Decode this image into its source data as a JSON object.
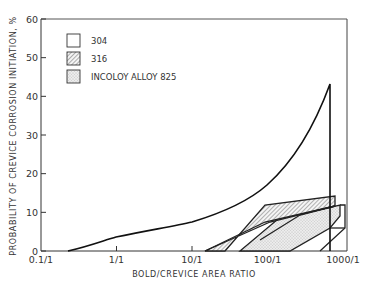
{
  "chart_data": {
    "type": "line",
    "title": "",
    "xlabel": "BOLD/CREVICE AREA RATIO",
    "ylabel": "PROBABILITY OF CREVICE CORROSION INITIATION, %",
    "x_scale": "log",
    "x_ticks": [
      "0.1/1",
      "1/1",
      "10/1",
      "100/1",
      "1000/1"
    ],
    "x_tick_values": [
      0.1,
      1,
      10,
      100,
      1000
    ],
    "y_ticks": [
      "0",
      "10",
      "20",
      "30",
      "40",
      "50",
      "60"
    ],
    "ylim": [
      0,
      60
    ],
    "grid": false,
    "legend_position": "upper-left",
    "legend": [
      {
        "label": "304",
        "pattern": "open"
      },
      {
        "label": "316",
        "pattern": "hatched"
      },
      {
        "label": "INCOLOY ALLOY 825",
        "pattern": "stippled"
      }
    ],
    "series": [
      {
        "name": "304",
        "kind": "curve",
        "points": [
          [
            0.23,
            0
          ],
          [
            0.5,
            1.5
          ],
          [
            1,
            3.5
          ],
          [
            3,
            5.2
          ],
          [
            10,
            7
          ],
          [
            30,
            10.5
          ],
          [
            100,
            17
          ],
          [
            300,
            30
          ],
          [
            600,
            42
          ],
          [
            600,
            0
          ]
        ]
      },
      {
        "name": "316",
        "kind": "band",
        "lower": [
          [
            25,
            0
          ],
          [
            100,
            3
          ],
          [
            500,
            10
          ],
          [
            650,
            11.5
          ]
        ],
        "upper": [
          [
            25,
            0
          ],
          [
            100,
            12
          ],
          [
            300,
            13.2
          ],
          [
            650,
            14
          ]
        ]
      },
      {
        "name": "INCOLOY ALLOY 825",
        "kind": "band",
        "lower": [
          [
            70,
            0
          ],
          [
            300,
            0
          ],
          [
            750,
            6.5
          ],
          [
            750,
            11.5
          ]
        ],
        "upper": [
          [
            70,
            0
          ],
          [
            200,
            8
          ],
          [
            650,
            11.5
          ],
          [
            750,
            11.5
          ]
        ]
      }
    ]
  }
}
